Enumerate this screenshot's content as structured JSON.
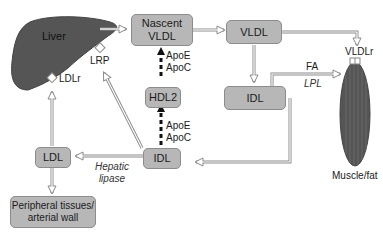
{
  "organs": {
    "liver": "Liver",
    "muscle": "Muscle/fat"
  },
  "boxes": {
    "nascent_vldl": [
      "Nascent",
      "VLDL"
    ],
    "vldl": "VLDL",
    "hdl2": "HDL2",
    "idl_right": "IDL",
    "idl_center": "IDL",
    "ldl": "LDL",
    "peripheral": [
      "Peripheral tissues/",
      "arterial wall"
    ]
  },
  "receptors": {
    "ldlr": "LDLr",
    "lrp": "LRP",
    "vldlr": "VLDLr"
  },
  "labels": {
    "apo_top": [
      "ApoE",
      "ApoC"
    ],
    "apo_bottom": [
      "ApoE",
      "ApoC"
    ],
    "fa": "FA",
    "lpl": "LPL",
    "hepatic_lipase": [
      "Hepatic",
      "lipase"
    ]
  },
  "colors": {
    "box_fill": "#b7b7b7",
    "organ_fill": "#555555",
    "arrow_stroke": "#8a8a8a"
  }
}
